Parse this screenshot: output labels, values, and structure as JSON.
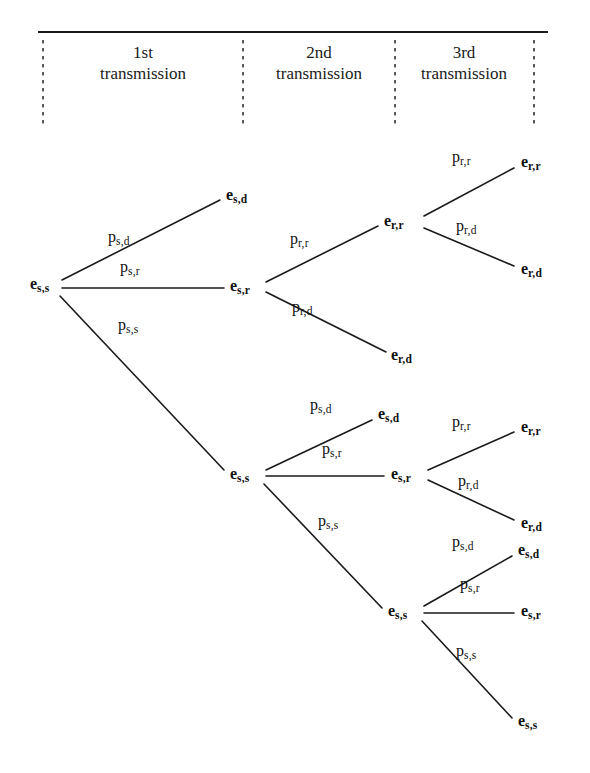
{
  "figure": {
    "type": "probability-tree-diagram",
    "width": 590,
    "height": 773,
    "background_color": "#ffffff",
    "line_color": "#1a1a1a"
  },
  "header": {
    "rule": {
      "x1": 38,
      "x2": 548,
      "y": 32
    },
    "columns": [
      {
        "id": "col-1",
        "ordinal": "1st",
        "word": "transmission",
        "label": "1st\ntransmission",
        "cx": 143,
        "y": 42
      },
      {
        "id": "col-2",
        "ordinal": "2nd",
        "word": "transmission",
        "label": "2nd\ntransmission",
        "cx": 319,
        "y": 42
      },
      {
        "id": "col-3",
        "ordinal": "3rd",
        "word": "transmission",
        "label": "3rd\ntransmission",
        "cx": 464,
        "y": 42
      }
    ],
    "dividers": [
      {
        "id": "divider-1",
        "x": 43,
        "y1": 40,
        "y2": 128
      },
      {
        "id": "divider-2",
        "x": 243,
        "y1": 40,
        "y2": 128
      },
      {
        "id": "divider-3",
        "x": 395,
        "y1": 40,
        "y2": 128
      },
      {
        "id": "divider-4",
        "x": 534,
        "y1": 40,
        "y2": 128
      }
    ]
  },
  "nodes": [
    {
      "id": "n-root",
      "base": "e",
      "sub": "s,s",
      "x": 30,
      "y": 285,
      "anchor": "left",
      "level": 0
    },
    {
      "id": "n-l1-d",
      "base": "e",
      "sub": "s,d",
      "x": 226,
      "y": 196,
      "anchor": "left",
      "level": 1
    },
    {
      "id": "n-l1-r",
      "base": "e",
      "sub": "s,r",
      "x": 230,
      "y": 287,
      "anchor": "left",
      "level": 1
    },
    {
      "id": "n-l1-s",
      "base": "e",
      "sub": "s,s",
      "x": 230,
      "y": 475,
      "anchor": "left",
      "level": 1
    },
    {
      "id": "n-l2-rr",
      "base": "e",
      "sub": "r,r",
      "x": 384,
      "y": 222,
      "anchor": "left",
      "level": 2
    },
    {
      "id": "n-l2-rd",
      "base": "e",
      "sub": "r,d",
      "x": 391,
      "y": 356,
      "anchor": "left",
      "level": 2
    },
    {
      "id": "n-l2-sd",
      "base": "e",
      "sub": "s,d",
      "x": 378,
      "y": 415,
      "anchor": "left",
      "level": 2
    },
    {
      "id": "n-l2-sr",
      "base": "e",
      "sub": "s,r",
      "x": 391,
      "y": 475,
      "anchor": "left",
      "level": 2
    },
    {
      "id": "n-l2-ss",
      "base": "e",
      "sub": "s,s",
      "x": 388,
      "y": 612,
      "anchor": "left",
      "level": 2
    },
    {
      "id": "n-l3-rr-top",
      "base": "e",
      "sub": "r,r",
      "x": 521,
      "y": 163,
      "anchor": "left",
      "level": 3
    },
    {
      "id": "n-l3-rd-top",
      "base": "e",
      "sub": "r,d",
      "x": 521,
      "y": 270,
      "anchor": "left",
      "level": 3
    },
    {
      "id": "n-l3-rr-mid",
      "base": "e",
      "sub": "r,r",
      "x": 521,
      "y": 428,
      "anchor": "left",
      "level": 3
    },
    {
      "id": "n-l3-rd-mid",
      "base": "e",
      "sub": "r,d",
      "x": 521,
      "y": 524,
      "anchor": "left",
      "level": 3
    },
    {
      "id": "n-l3-sd-bot",
      "base": "e",
      "sub": "s,d",
      "x": 518,
      "y": 551,
      "anchor": "left",
      "level": 3
    },
    {
      "id": "n-l3-sr-bot",
      "base": "e",
      "sub": "s,r",
      "x": 521,
      "y": 612,
      "anchor": "left",
      "level": 3
    },
    {
      "id": "n-l3-ss-bot",
      "base": "e",
      "sub": "s,s",
      "x": 518,
      "y": 722,
      "anchor": "left",
      "level": 3
    }
  ],
  "edges": [
    {
      "id": "e-root-sd",
      "from": "n-root",
      "to": "n-l1-d",
      "x1": 62,
      "y1": 280,
      "x2": 220,
      "y2": 200
    },
    {
      "id": "e-root-sr",
      "from": "n-root",
      "to": "n-l1-r",
      "x1": 62,
      "y1": 288,
      "x2": 224,
      "y2": 288
    },
    {
      "id": "e-root-ss",
      "from": "n-root",
      "to": "n-l1-s",
      "x1": 60,
      "y1": 296,
      "x2": 224,
      "y2": 470
    },
    {
      "id": "e-sr-rr",
      "from": "n-l1-r",
      "to": "n-l2-rr",
      "x1": 266,
      "y1": 282,
      "x2": 378,
      "y2": 226
    },
    {
      "id": "e-sr-rd",
      "from": "n-l1-r",
      "to": "n-l2-rd",
      "x1": 266,
      "y1": 292,
      "x2": 386,
      "y2": 352
    },
    {
      "id": "e-rr-rr",
      "from": "n-l2-rr",
      "to": "n-l3-rr-top",
      "x1": 424,
      "y1": 216,
      "x2": 514,
      "y2": 168
    },
    {
      "id": "e-rr-rd",
      "from": "n-l2-rr",
      "to": "n-l3-rd-top",
      "x1": 424,
      "y1": 228,
      "x2": 514,
      "y2": 266
    },
    {
      "id": "e-ss-sd",
      "from": "n-l1-s",
      "to": "n-l2-sd",
      "x1": 266,
      "y1": 470,
      "x2": 372,
      "y2": 420
    },
    {
      "id": "e-ss-sr",
      "from": "n-l1-s",
      "to": "n-l2-sr",
      "x1": 266,
      "y1": 476,
      "x2": 384,
      "y2": 476
    },
    {
      "id": "e-ss-ss",
      "from": "n-l1-s",
      "to": "n-l2-ss",
      "x1": 264,
      "y1": 484,
      "x2": 382,
      "y2": 608
    },
    {
      "id": "e-sr2-rr",
      "from": "n-l2-sr",
      "to": "n-l3-rr-mid",
      "x1": 428,
      "y1": 470,
      "x2": 514,
      "y2": 432
    },
    {
      "id": "e-sr2-rd",
      "from": "n-l2-sr",
      "to": "n-l3-rd-mid",
      "x1": 428,
      "y1": 480,
      "x2": 514,
      "y2": 520
    },
    {
      "id": "e-ss2-sd",
      "from": "n-l2-ss",
      "to": "n-l3-sd-bot",
      "x1": 424,
      "y1": 606,
      "x2": 512,
      "y2": 556
    },
    {
      "id": "e-ss2-sr",
      "from": "n-l2-ss",
      "to": "n-l3-sr-bot",
      "x1": 424,
      "y1": 613,
      "x2": 514,
      "y2": 613
    },
    {
      "id": "e-ss2-ss",
      "from": "n-l2-ss",
      "to": "n-l3-ss-bot",
      "x1": 422,
      "y1": 621,
      "x2": 512,
      "y2": 718
    }
  ],
  "edge_labels": [
    {
      "id": "lbl-root-sd",
      "for": "e-root-sd",
      "base": "p",
      "sub": "s,d",
      "x": 108,
      "y": 238
    },
    {
      "id": "lbl-root-sr",
      "for": "e-root-sr",
      "base": "p",
      "sub": "s,r",
      "x": 120,
      "y": 268
    },
    {
      "id": "lbl-root-ss",
      "for": "e-root-ss",
      "base": "p",
      "sub": "s,s",
      "x": 118,
      "y": 326
    },
    {
      "id": "lbl-sr-rr",
      "for": "e-sr-rr",
      "base": "p",
      "sub": "r,r",
      "x": 290,
      "y": 240
    },
    {
      "id": "lbl-sr-rd",
      "for": "e-sr-rd",
      "base": "p",
      "sub": "r,d",
      "x": 292,
      "y": 308
    },
    {
      "id": "lbl-rr-rr",
      "for": "e-rr-rr",
      "base": "p",
      "sub": "r,r",
      "x": 452,
      "y": 158
    },
    {
      "id": "lbl-rr-rd",
      "for": "e-rr-rd",
      "base": "p",
      "sub": "r,d",
      "x": 456,
      "y": 227
    },
    {
      "id": "lbl-ss-sd",
      "for": "e-ss-sd",
      "base": "p",
      "sub": "s,d",
      "x": 310,
      "y": 406
    },
    {
      "id": "lbl-ss-sr",
      "for": "e-ss-sr",
      "base": "p",
      "sub": "s,r",
      "x": 322,
      "y": 450
    },
    {
      "id": "lbl-ss-ss",
      "for": "e-ss-ss",
      "base": "p",
      "sub": "s,s",
      "x": 318,
      "y": 522
    },
    {
      "id": "lbl-sr2-rr",
      "for": "e-sr2-rr",
      "base": "p",
      "sub": "r,r",
      "x": 452,
      "y": 423
    },
    {
      "id": "lbl-sr2-rd",
      "for": "e-sr2-rd",
      "base": "p",
      "sub": "r,d",
      "x": 458,
      "y": 482
    },
    {
      "id": "lbl-ss2-sd",
      "for": "e-ss2-sd",
      "base": "p",
      "sub": "s,d",
      "x": 452,
      "y": 543
    },
    {
      "id": "lbl-ss2-sr",
      "for": "e-ss2-sr",
      "base": "p",
      "sub": "s,r",
      "x": 460,
      "y": 585
    },
    {
      "id": "lbl-ss2-ss",
      "for": "e-ss2-ss",
      "base": "p",
      "sub": "s,s",
      "x": 456,
      "y": 652
    }
  ]
}
